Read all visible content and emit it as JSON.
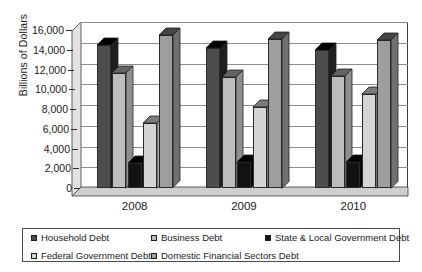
{
  "chart_data": {
    "type": "bar",
    "title": "",
    "xlabel": "",
    "ylabel": "Billions of Dollars",
    "categories": [
      "2008",
      "2009",
      "2010"
    ],
    "ylim": [
      0,
      16000
    ],
    "ytick_values": [
      0,
      2000,
      4000,
      6000,
      8000,
      10000,
      12000,
      14000,
      16000
    ],
    "ytick_labels": [
      "0",
      "2,000",
      "4,000",
      "6,000",
      "8,000",
      "10,000",
      "12,000",
      "14,000",
      "16,000"
    ],
    "grid": true,
    "legend_position": "bottom",
    "series": [
      {
        "name": "Household Debt",
        "color": "#4d4d4d",
        "values": [
          13800,
          13500,
          13300
        ]
      },
      {
        "name": "Business Debt",
        "color": "#bdbdbd",
        "values": [
          11100,
          10700,
          10800
        ]
      },
      {
        "name": "State & Local Government Debt",
        "color": "#121212",
        "values": [
          2400,
          2500,
          2500
        ]
      },
      {
        "name": "Federal Government Debt",
        "color": "#d4d4d4",
        "values": [
          6300,
          7800,
          9100
        ]
      },
      {
        "name": "Domestic Financial Sectors Debt",
        "color": "#9e9e9e",
        "values": [
          14700,
          14400,
          14300
        ]
      }
    ]
  },
  "axis": {
    "y_title": "Billions of Dollars"
  },
  "legend": {
    "items": [
      {
        "label": "Household Debt"
      },
      {
        "label": "Business Debt"
      },
      {
        "label": "State & Local Government Debt"
      },
      {
        "label": "Federal Government Debt"
      },
      {
        "label": "Domestic Financial Sectors Debt"
      }
    ]
  }
}
